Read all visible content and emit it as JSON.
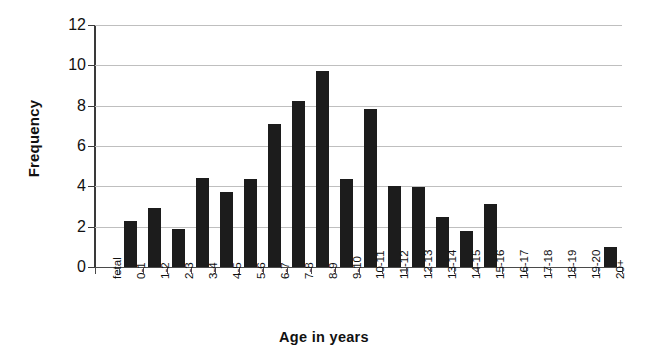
{
  "chart_data": {
    "type": "bar",
    "title": "",
    "xlabel": "Age in years",
    "ylabel": "Frequency",
    "categories": [
      "fetal",
      "0-1",
      "1-2",
      "2-3",
      "3-4",
      "4-5",
      "5-6",
      "6-7",
      "7-8",
      "8-9",
      "9-10",
      "10-11",
      "11-12",
      "12-13",
      "13-14",
      "14-15",
      "15-16",
      "16-17",
      "17-18",
      "18-19",
      "19-20",
      "20+"
    ],
    "values": [
      0,
      2.3,
      2.95,
      1.9,
      4.4,
      3.7,
      4.35,
      7.1,
      8.25,
      9.7,
      4.35,
      7.85,
      4.0,
      3.95,
      2.5,
      1.8,
      3.1,
      0,
      0,
      0,
      0,
      1.0
    ],
    "ylim": [
      0,
      12
    ],
    "ytick_labels": [
      "0",
      "2",
      "4",
      "6",
      "8",
      "10",
      "12"
    ],
    "ytick_values": [
      0,
      2,
      4,
      6,
      8,
      10,
      12
    ],
    "grid": true,
    "legend": false,
    "bar_color": "#1c1c1c",
    "grid_color": "#bfbfbf",
    "axis_color": "#4a4a4a"
  }
}
